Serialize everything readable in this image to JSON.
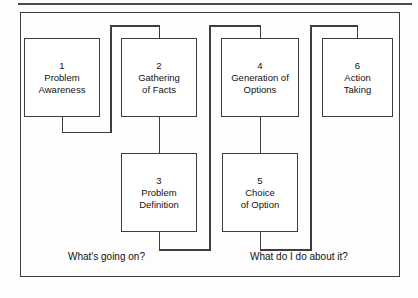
{
  "diagram": {
    "frame_color": "#3d3d3d",
    "box_fill": "#ffffff",
    "text_color": "#111111",
    "boxes": [
      {
        "number": "1",
        "label": "Problem\nAwareness"
      },
      {
        "number": "2",
        "label": "Gathering\nof Facts"
      },
      {
        "number": "3",
        "label": "Problem\nDefinition"
      },
      {
        "number": "4",
        "label": "Generation of\nOptions"
      },
      {
        "number": "5",
        "label": "Choice\nof Option"
      },
      {
        "number": "6",
        "label": "Action\nTaking"
      }
    ],
    "captions": [
      {
        "text": "What's going on?"
      },
      {
        "text": "What do I do about it?"
      }
    ]
  }
}
